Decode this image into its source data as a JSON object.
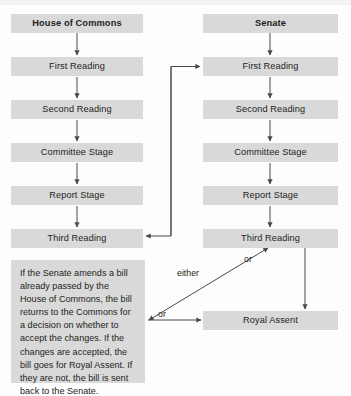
{
  "diagram": {
    "box_fill": "#d9d9d9",
    "text_color": "#231f20",
    "line_color": "#4a4a4a",
    "background": "#fdfdfd",
    "columns": {
      "left": {
        "header": "House of Commons",
        "stages": [
          "First Reading",
          "Second Reading",
          "Committee Stage",
          "Report Stage",
          "Third Reading"
        ]
      },
      "right": {
        "header": "Senate",
        "stages": [
          "First Reading",
          "Second Reading",
          "Committee Stage",
          "Report Stage",
          "Third Reading"
        ]
      }
    },
    "final_node": "Royal Assent",
    "note": "If the Senate amends a bill already passed by the House of Commons, the bill returns to the Commons for a decision on whether to accept the changes. If the changes are accepted, the bill goes for Royal Assent. If they are not, the bill is sent back to the Senate.",
    "edge_labels": {
      "or_top": "or",
      "either": "either",
      "or_bottom": "or"
    }
  }
}
